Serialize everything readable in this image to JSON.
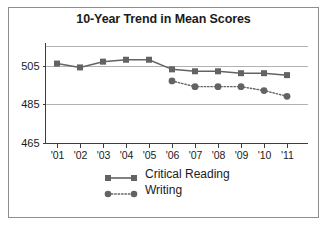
{
  "chart_data": {
    "type": "line",
    "title": "10-Year Trend in Mean Scores",
    "xlabel": "",
    "ylabel": "",
    "categories": [
      "'01",
      "'02",
      "'03",
      "'04",
      "'05",
      "'06",
      "'07",
      "'08",
      "'09",
      "'10",
      "'11"
    ],
    "yticks": [
      465,
      485,
      505
    ],
    "ytick_labels": [
      "465",
      "485",
      "505"
    ],
    "ylim": [
      465,
      515
    ],
    "grid": true,
    "gridlines_y": [
      485,
      505,
      515
    ],
    "legend_position": "bottom",
    "series": [
      {
        "name": "Critical Reading",
        "marker": "square",
        "linestyle": "solid",
        "color": "#636363",
        "values": [
          506,
          504,
          507,
          508,
          508,
          503,
          502,
          502,
          501,
          501,
          500
        ]
      },
      {
        "name": "Writing",
        "marker": "circle",
        "linestyle": "dotted",
        "color": "#636363",
        "values": [
          null,
          null,
          null,
          null,
          null,
          497,
          494,
          494,
          494,
          492,
          489
        ]
      }
    ]
  },
  "figure": {
    "title": "10-Year Trend in Mean Scores",
    "border_color": "#8d8d8d",
    "background": "#ffffff",
    "axis_color": "#3d3d3d",
    "grid_color": "#b2b2b2",
    "series_color": "#636363"
  },
  "legend": {
    "entries": [
      {
        "label": "Critical Reading",
        "marker": "square",
        "linestyle": "solid"
      },
      {
        "label": "Writing",
        "marker": "circle",
        "linestyle": "dotted"
      }
    ]
  }
}
